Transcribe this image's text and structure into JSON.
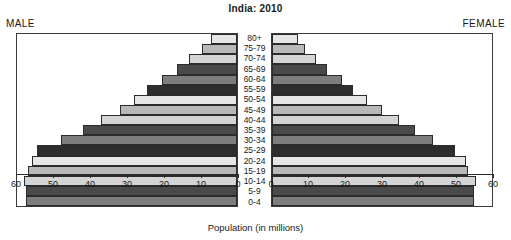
{
  "chart": {
    "title": "India: 2010",
    "male_caption": "MALE",
    "female_caption": "FEMALE",
    "xlabel": "Population (in millions)"
  },
  "chart_data": {
    "type": "bar",
    "subtype": "population-pyramid",
    "title": "India: 2010",
    "xlabel": "Population (in millions)",
    "ylabel": "",
    "orientation": "horizontal",
    "grid": false,
    "legend": "none",
    "xlim_male": [
      60,
      0
    ],
    "xlim_female": [
      0,
      60
    ],
    "xticks_male": [
      60,
      50,
      40,
      30,
      20,
      10,
      0
    ],
    "xticks_female": [
      0,
      10,
      20,
      30,
      40,
      50,
      60
    ],
    "categories": [
      "80+",
      "75-79",
      "70-74",
      "65-69",
      "60-64",
      "55-59",
      "50-54",
      "45-49",
      "40-44",
      "35-39",
      "30-34",
      "25-29",
      "20-24",
      "15-19",
      "10-14",
      "5-9",
      "0-4"
    ],
    "series": [
      {
        "name": "MALE",
        "side": "left",
        "values": [
          7.0,
          9.5,
          13.0,
          16.5,
          20.5,
          24.5,
          28.0,
          32.0,
          37.0,
          42.0,
          48.0,
          54.5,
          56.0,
          57.0,
          58.0,
          57.5,
          57.5
        ]
      },
      {
        "name": "FEMALE",
        "side": "right",
        "values": [
          7.0,
          9.0,
          12.0,
          15.0,
          19.0,
          22.0,
          26.0,
          30.0,
          34.5,
          39.0,
          44.0,
          50.0,
          53.0,
          53.5,
          55.5,
          55.0,
          55.0
        ]
      }
    ],
    "bar_colors": [
      "#e6e6e6",
      "#b8b8b8",
      "#d4d4d4",
      "#4a4a4a",
      "#7d7d7d",
      "#2e2e2e"
    ]
  }
}
